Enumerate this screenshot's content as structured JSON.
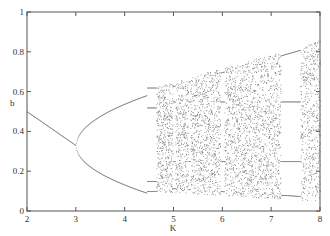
{
  "chart_data": {
    "type": "scatter",
    "title": "",
    "xlabel": "K",
    "ylabel": "b",
    "xlim": [
      2,
      8
    ],
    "ylim": [
      0,
      1
    ],
    "xticks": [
      "2",
      "3",
      "4",
      "5",
      "6",
      "7",
      "8"
    ],
    "yticks": [
      "0",
      "0.2",
      "0.4",
      "0.6",
      "0.8",
      "1"
    ],
    "grid": false
  }
}
